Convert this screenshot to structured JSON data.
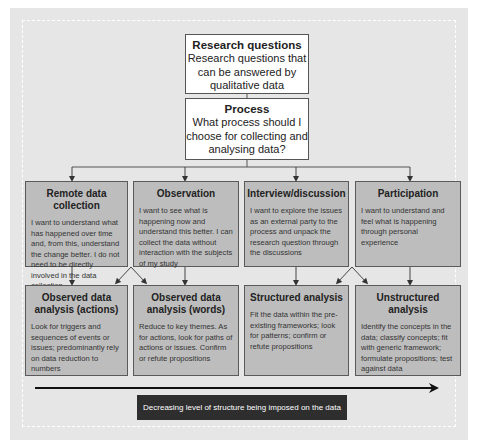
{
  "diagram": {
    "top": {
      "research": {
        "title": "Research questions",
        "description": "Research questions that can be answered by qualitative data"
      },
      "process": {
        "title": "Process",
        "description": "What process should I choose for collecting and analysing data?"
      }
    },
    "collection_methods": [
      {
        "title": "Remote data collection",
        "description": "I want to understand what has happened over time and, from this, understand the change better. I do not need to be directly involved in the data collection"
      },
      {
        "title": "Observation",
        "description": "I want to see what is happening now and understand this better. I can collect the data without interaction with the subjects of my study"
      },
      {
        "title": "Interview/discussion",
        "description": "I want to explore the issues as an external party to the process and unpack the research question through the discussions"
      },
      {
        "title": "Participation",
        "description": "I want to understand and feel what is happening through personal experience"
      }
    ],
    "analysis_methods": [
      {
        "title": "Observed data analysis (actions)",
        "description": "Look for triggers and sequences of events or issues; predominantly rely on data reduction to numbers"
      },
      {
        "title": "Observed data analysis (words)",
        "description": "Reduce to key themes. As for actions, look for paths of actions or issues. Confirm or refute propositions"
      },
      {
        "title": "Structured analysis",
        "description": "Fit the data within the pre-existing frameworks; look for patterns; confirm or refute propositions"
      },
      {
        "title": "Unstructured analysis",
        "description": "Identify the concepts in the data; classify concepts; fit with generic framework; formulate propositions; test against data"
      }
    ],
    "axis_label": "Decreasing level of structure being imposed on the data",
    "colors": {
      "background": "#e6e6e6",
      "box_grey": "#bdbdbd",
      "label_dark": "#2e2e2e",
      "line": "#444444"
    }
  }
}
